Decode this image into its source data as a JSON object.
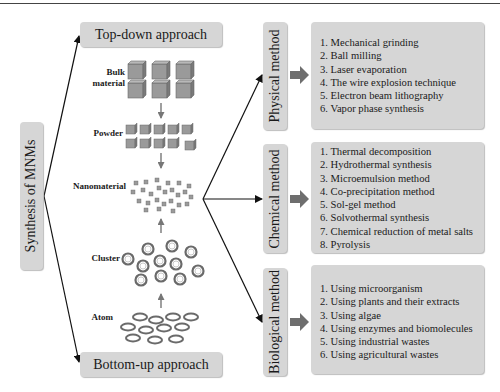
{
  "root": {
    "label": "Synthesis of MNMs"
  },
  "approaches": {
    "top_down": "Top-down approach",
    "bottom_up": "Bottom-up approach"
  },
  "stages": {
    "bulk": "Bulk\nmaterial",
    "bulk_line1": "Bulk",
    "bulk_line2": "material",
    "powder": "Powder",
    "nanomaterial": "Nanomaterial",
    "cluster": "Cluster",
    "atom": "Atom"
  },
  "methods": [
    {
      "label": "Physical method",
      "items": [
        "1. Mechanical grinding",
        "2. Ball milling",
        "3. Laser evaporation",
        "4. The wire explosion technique",
        "5. Electron beam lithography",
        "6. Vapor phase synthesis"
      ]
    },
    {
      "label": "Chemical method",
      "items": [
        "1. Thermal decomposition",
        "2. Hydrothermal synthesis",
        "3. Microemulsion method",
        "4. Co-precipitation method",
        "5. Sol-gel method",
        "6. Solvothermal synthesis",
        "7. Chemical reduction of metal salts",
        "8. Pyrolysis"
      ]
    },
    {
      "label": "Biological method",
      "items": [
        "1. Using microorganism",
        "2. Using plants and their extracts",
        "3. Using algae",
        "4. Using enzymes and biomolecules",
        "5. Using industrial wastes",
        "6. Using agricultural wastes"
      ]
    }
  ],
  "colors": {
    "box_fill": "#d6d6d6",
    "shape_fill": "#9a9a9a",
    "arrow": "#111111",
    "block_arrow": "#6e6e6e"
  }
}
